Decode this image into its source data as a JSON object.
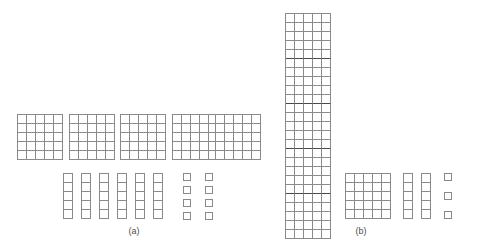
{
  "figure": {
    "background_color": "#ffffff",
    "line_color": "#8a8a8a",
    "band_color": "#4a4a4a",
    "base": 5,
    "cell_size_px": 9,
    "panels": [
      {
        "id": "a",
        "caption": "(a)",
        "caption_x": 134,
        "caption_y": 226,
        "total_units": 163,
        "groups": [
          {
            "name": "flats",
            "piece_label": "flat",
            "unit_value": 25,
            "count": 5,
            "cols": 5,
            "rows": 5,
            "banded": false,
            "positions": [
              {
                "x": 17,
                "y": 114
              },
              {
                "x": 69,
                "y": 114
              },
              {
                "x": 120,
                "y": 114
              },
              {
                "x": 172,
                "y": 114
              },
              {
                "x": 215,
                "y": 114
              }
            ]
          },
          {
            "name": "longs",
            "piece_label": "long",
            "unit_value": 5,
            "count": 6,
            "cols": 1,
            "rows": 5,
            "banded": false,
            "positions": [
              {
                "x": 63,
                "y": 173
              },
              {
                "x": 81,
                "y": 173
              },
              {
                "x": 99,
                "y": 173
              },
              {
                "x": 117,
                "y": 173
              },
              {
                "x": 135,
                "y": 173
              },
              {
                "x": 153,
                "y": 173
              }
            ]
          },
          {
            "name": "units",
            "piece_label": "unit",
            "unit_value": 1,
            "count": 8,
            "size": 8,
            "positions": [
              {
                "x": 183,
                "y": 173
              },
              {
                "x": 183,
                "y": 186
              },
              {
                "x": 183,
                "y": 199
              },
              {
                "x": 183,
                "y": 212
              },
              {
                "x": 205,
                "y": 173
              },
              {
                "x": 205,
                "y": 186
              },
              {
                "x": 205,
                "y": 199
              },
              {
                "x": 205,
                "y": 212
              }
            ]
          }
        ]
      },
      {
        "id": "b",
        "caption": "(b)",
        "caption_x": 361,
        "caption_y": 226,
        "total_units": 163,
        "groups": [
          {
            "name": "block",
            "piece_label": "block",
            "unit_value": 125,
            "count": 1,
            "cols": 5,
            "rows": 25,
            "banded": true,
            "band_every": 5,
            "positions": [
              {
                "x": 285,
                "y": 13
              }
            ]
          },
          {
            "name": "flats",
            "piece_label": "flat",
            "unit_value": 25,
            "count": 1,
            "cols": 5,
            "rows": 5,
            "banded": false,
            "positions": [
              {
                "x": 345,
                "y": 173
              }
            ]
          },
          {
            "name": "longs",
            "piece_label": "long",
            "unit_value": 5,
            "count": 2,
            "cols": 1,
            "rows": 5,
            "banded": false,
            "positions": [
              {
                "x": 403,
                "y": 173
              },
              {
                "x": 421,
                "y": 173
              }
            ]
          },
          {
            "name": "units",
            "piece_label": "unit",
            "unit_value": 1,
            "count": 3,
            "size": 8,
            "positions": [
              {
                "x": 444,
                "y": 173
              },
              {
                "x": 444,
                "y": 192
              },
              {
                "x": 444,
                "y": 211
              }
            ]
          }
        ]
      }
    ]
  }
}
